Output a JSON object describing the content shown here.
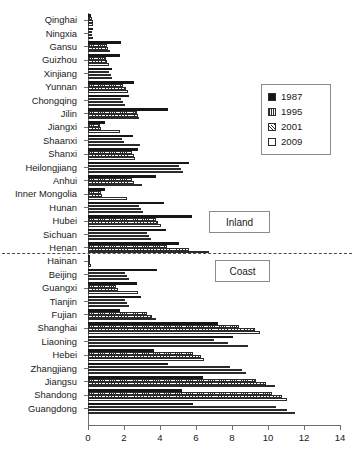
{
  "chart_data": {
    "type": "bar",
    "orientation": "horizontal",
    "title": "",
    "xlabel": "",
    "ylabel": "",
    "xlim": [
      0,
      14
    ],
    "xticks": [
      0,
      2,
      4,
      6,
      8,
      10,
      12,
      14
    ],
    "grid": false,
    "legend_position": "upper right",
    "legend": [
      "1987",
      "1995",
      "2001",
      "2009"
    ],
    "categories": [
      "Qinghai",
      "Ningxia",
      "Gansu",
      "Guizhou",
      "Xinjiang",
      "Yunnan",
      "Chongqing",
      "Jilin",
      "Jiangxi",
      "Shaanxi",
      "Shanxi",
      "Heilongjiang",
      "Anhui",
      "Inner Mongolia",
      "Hunan",
      "Hubei",
      "Sichuan",
      "Henan",
      "Hainan",
      "Beijing",
      "Guangxi",
      "Tianjin",
      "Fujian",
      "Shanghai",
      "Liaoning",
      "Hebei",
      "Zhangjiang",
      "Jiangsu",
      "Shandong",
      "Guangdong"
    ],
    "series": [
      {
        "name": "1987",
        "values": [
          0.18,
          0.25,
          1.85,
          1.75,
          1.35,
          2.55,
          2.3,
          4.45,
          0.95,
          2.5,
          2.75,
          5.6,
          3.75,
          0.95,
          4.2,
          5.8,
          4.35,
          5.05,
          0.12,
          3.85,
          2.7,
          2.95,
          1.75,
          7.2,
          8.05,
          3.65,
          4.45,
          6.4,
          5.2,
          5.85
        ]
      },
      {
        "name": "1995",
        "values": [
          0.22,
          0.2,
          1.05,
          1.0,
          1.15,
          1.95,
          1.85,
          2.7,
          0.65,
          1.9,
          2.45,
          5.05,
          2.45,
          0.7,
          2.85,
          3.75,
          3.3,
          4.4,
          0.1,
          2.05,
          1.55,
          2.05,
          3.25,
          8.4,
          7.0,
          5.85,
          7.9,
          9.35,
          10.2,
          10.45
        ]
      },
      {
        "name": "2001",
        "values": [
          0.25,
          0.22,
          1.1,
          1.05,
          1.25,
          2.1,
          1.95,
          2.75,
          0.7,
          2.0,
          2.55,
          5.15,
          2.55,
          0.8,
          2.95,
          3.9,
          3.4,
          5.6,
          0.12,
          2.15,
          1.65,
          2.15,
          3.55,
          9.3,
          7.75,
          6.25,
          8.55,
          9.9,
          10.8,
          11.05
        ]
      },
      {
        "name": "2009",
        "values": [
          0.28,
          0.26,
          1.2,
          1.15,
          1.35,
          2.2,
          2.05,
          2.85,
          1.8,
          2.9,
          2.6,
          5.25,
          3.0,
          2.15,
          3.05,
          4.05,
          3.5,
          6.7,
          0.15,
          2.3,
          2.75,
          2.25,
          3.75,
          9.55,
          8.9,
          6.45,
          8.8,
          10.4,
          11.05,
          11.5
        ]
      }
    ],
    "series_styles": {
      "1987": "solid-black",
      "1995": "vertical-hatch",
      "2001": "diagonal-hatch",
      "2009": "white-empty"
    },
    "annotations": [
      {
        "label": "Inland",
        "kind": "region-box"
      },
      {
        "label": "Coast",
        "kind": "region-box"
      }
    ],
    "divider": {
      "between": [
        "Sichuan",
        "Henan"
      ],
      "style": "dashed"
    }
  },
  "colors": {
    "series_1987": "#161616",
    "hatch": "#2b2b2b",
    "axis": "#6e6e6e",
    "box_border": "#8a8a8a",
    "background": "#ffffff"
  }
}
